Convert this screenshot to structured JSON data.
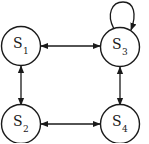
{
  "diagram": {
    "type": "state-transition-graph",
    "colors": {
      "stroke": "#1a1a1a",
      "background": "#ffffff"
    },
    "states": [
      {
        "id": "S1",
        "letter": "S",
        "sub": "1"
      },
      {
        "id": "S2",
        "letter": "S",
        "sub": "2"
      },
      {
        "id": "S3",
        "letter": "S",
        "sub": "3"
      },
      {
        "id": "S4",
        "letter": "S",
        "sub": "4"
      }
    ],
    "edges": [
      {
        "from": "S1",
        "to": "S3",
        "direction": "bidirectional"
      },
      {
        "from": "S1",
        "to": "S2",
        "direction": "bidirectional"
      },
      {
        "from": "S2",
        "to": "S4",
        "direction": "bidirectional"
      },
      {
        "from": "S3",
        "to": "S4",
        "direction": "bidirectional"
      },
      {
        "from": "S3",
        "to": "S3",
        "direction": "self-loop"
      }
    ]
  }
}
